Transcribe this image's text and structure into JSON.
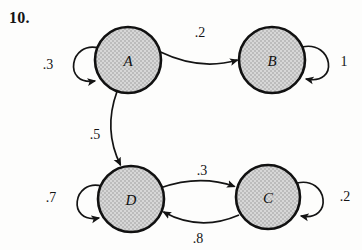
{
  "figure": {
    "problem_number": "10.",
    "type": "state-transition-diagram",
    "background_color": "#fdfdfc",
    "node_fill_color": "#c9c9c9",
    "node_stroke_color": "#111111",
    "edge_color": "#141414"
  },
  "nodes": [
    {
      "id": "A",
      "label": "A",
      "cx": 128,
      "cy": 60,
      "r": 33
    },
    {
      "id": "B",
      "label": "B",
      "cx": 272,
      "cy": 60,
      "r": 33
    },
    {
      "id": "D",
      "label": "D",
      "cx": 131,
      "cy": 199,
      "r": 33
    },
    {
      "id": "C",
      "label": "C",
      "cx": 268,
      "cy": 197,
      "r": 32
    }
  ],
  "edges": [
    {
      "id": "a-to-b",
      "from": "A",
      "to": "B",
      "label": ".2",
      "label_x": 200,
      "label_y": 33
    },
    {
      "id": "a-to-d",
      "from": "A",
      "to": "D",
      "label": ".5",
      "label_x": 95,
      "label_y": 135
    },
    {
      "id": "d-to-c",
      "from": "D",
      "to": "C",
      "label": ".3",
      "label_x": 202,
      "label_y": 171
    },
    {
      "id": "c-to-d",
      "from": "C",
      "to": "D",
      "label": ".8",
      "label_x": 198,
      "label_y": 239
    }
  ],
  "self_loops": [
    {
      "id": "a-self-loop",
      "node": "A",
      "label": ".3",
      "label_x": 48,
      "label_y": 65,
      "side": "left"
    },
    {
      "id": "b-self-loop",
      "node": "B",
      "label": "1",
      "label_x": 344,
      "label_y": 62,
      "side": "right"
    },
    {
      "id": "d-self-loop",
      "node": "D",
      "label": ".7",
      "label_x": 51,
      "label_y": 198,
      "side": "left"
    },
    {
      "id": "c-self-loop",
      "node": "C",
      "label": ".2",
      "label_x": 345,
      "label_y": 197,
      "side": "right"
    }
  ]
}
